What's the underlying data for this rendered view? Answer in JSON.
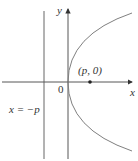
{
  "diagram": {
    "type": "parabola-focus-directrix",
    "colors": {
      "axis": "#333333",
      "curve": "#777777",
      "text": "#333333"
    },
    "labels": {
      "y_axis": "y",
      "x_axis": "x",
      "origin": "0",
      "focus": "(p, 0)",
      "directrix": "x = −p"
    }
  }
}
